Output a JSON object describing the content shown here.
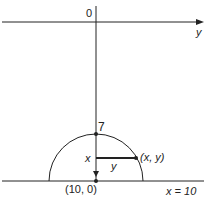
{
  "diagram": {
    "origin_label": "0",
    "y_axis_label": "y",
    "top_point_label": "7",
    "x_label": "x",
    "y_segment_label": "y",
    "point_label": "(x, y)",
    "bottom_point_label": "(10, 0)",
    "line_label": "x = 10",
    "colors": {
      "stroke": "#222222",
      "background": "#ffffff"
    }
  }
}
